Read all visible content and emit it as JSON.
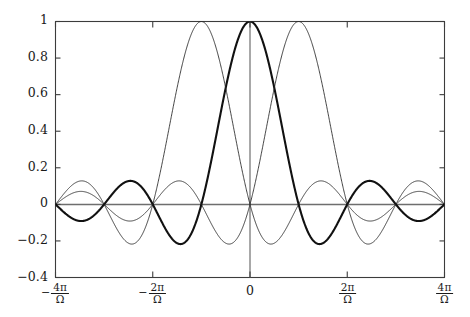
{
  "figure": {
    "background_color": "#ffffff",
    "frame_color": "#3c3c3c",
    "axis_color": "#555555"
  },
  "chart_data": {
    "type": "line",
    "title": "",
    "subtitle": "",
    "xlabel": "",
    "ylabel": "",
    "grid": false,
    "legend": null,
    "xlim": [
      -4,
      4
    ],
    "ylim": [
      -0.4,
      1.0
    ],
    "x_unit": "pi/Omega",
    "x_tick_values": [
      -4,
      -2,
      0,
      2,
      4
    ],
    "x_tick_labels": [
      "-4π/Ω",
      "-2π/Ω",
      "0",
      "2π/Ω",
      "4π/Ω"
    ],
    "y_tick_values": [
      1,
      0.8,
      0.6,
      0.4,
      0.2,
      0,
      -0.2,
      -0.4
    ],
    "y_tick_labels": [
      "1",
      "0.8",
      "0.6",
      "0.4",
      "0.2",
      "0",
      "-0.2",
      "-0.4"
    ],
    "series": [
      {
        "name": "sinc centered at 0",
        "formula": "sin(pi*x)/(pi*x)",
        "center": 0,
        "zero_crossings": [
          -4,
          -3,
          -2,
          -1,
          1,
          2,
          3,
          4
        ],
        "peak_value": 1,
        "peak_x": 0,
        "sidelobe_minima": [
          -0.217,
          0.217
        ],
        "line_width": 2.1,
        "color": "#111111",
        "emphasis": "bold"
      },
      {
        "name": "sinc centered at -1",
        "formula": "sin(pi*(x+1))/(pi*(x+1))",
        "center": -1,
        "zero_crossings": [
          -4,
          -3,
          -2,
          0,
          1,
          2,
          3,
          4
        ],
        "peak_value": 1,
        "peak_x": -1,
        "sidelobe_minima": [
          -0.217,
          0.217
        ],
        "line_width": 0.85,
        "color": "#222222",
        "emphasis": "thin"
      },
      {
        "name": "sinc centered at 1",
        "formula": "sin(pi*(x-1))/(pi*(x-1))",
        "center": 1,
        "zero_crossings": [
          -4,
          -3,
          -2,
          -1,
          0,
          2,
          3,
          4
        ],
        "peak_value": 1,
        "peak_x": 1,
        "sidelobe_minima": [
          -0.217,
          0.217
        ],
        "line_width": 0.85,
        "color": "#222222",
        "emphasis": "thin"
      }
    ],
    "annotations": []
  },
  "x_ticks": [
    {
      "id": "xm4",
      "sign": "−",
      "num": "4π",
      "den": "Ω"
    },
    {
      "id": "xm2",
      "sign": "−",
      "num": "2π",
      "den": "Ω"
    },
    {
      "id": "x0",
      "label": "0"
    },
    {
      "id": "xp2",
      "sign": "",
      "num": "2π",
      "den": "Ω"
    },
    {
      "id": "xp4",
      "sign": "",
      "num": "4π",
      "den": "Ω"
    }
  ],
  "y_ticks": [
    {
      "id": "y10",
      "label": "1"
    },
    {
      "id": "y08",
      "label": "0.8"
    },
    {
      "id": "y06",
      "label": "0.6"
    },
    {
      "id": "y04",
      "label": "0.4"
    },
    {
      "id": "y02",
      "label": "0.2"
    },
    {
      "id": "y00",
      "label": "0"
    },
    {
      "id": "ym02",
      "label": "−0.2"
    },
    {
      "id": "ym04",
      "label": "−0.4"
    }
  ]
}
